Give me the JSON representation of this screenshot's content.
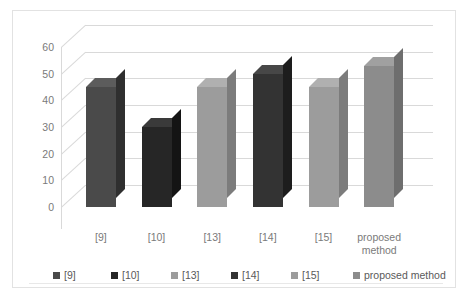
{
  "chart_data": {
    "type": "bar",
    "title": "",
    "xlabel": "",
    "ylabel": "",
    "categories": [
      "[9]",
      "[10]",
      "[13]",
      "[14]",
      "[15]",
      "proposed method"
    ],
    "values": [
      45,
      30,
      45,
      50,
      45,
      53
    ],
    "series": [
      {
        "name": "comparison",
        "values": [
          45,
          30,
          45,
          50,
          45,
          53
        ]
      }
    ],
    "ylim": [
      0,
      60
    ],
    "ytick_labels": [
      "60",
      "50",
      "40",
      "30",
      "20",
      "10",
      "0"
    ],
    "ytick_values": [
      60,
      50,
      40,
      30,
      20,
      10,
      0
    ],
    "grid": true,
    "three_d": true,
    "legend_position": "bottom",
    "legend": [
      {
        "label": "[9]",
        "color": "#4a4a4a"
      },
      {
        "label": "[10]",
        "color": "#262626"
      },
      {
        "label": "[13]",
        "color": "#9c9c9c"
      },
      {
        "label": "[14]",
        "color": "#333333"
      },
      {
        "label": "[15]",
        "color": "#9c9c9c"
      },
      {
        "label": "proposed method",
        "color": "#8c8c8c"
      }
    ],
    "bars": [
      {
        "label": "[9]",
        "value": 45,
        "face": "#4a4a4a",
        "top": "#5c5c5c",
        "side": "#2f2f2f"
      },
      {
        "label": "[10]",
        "value": 30,
        "face": "#262626",
        "top": "#3a3a3a",
        "side": "#141414"
      },
      {
        "label": "[13]",
        "value": 45,
        "face": "#9c9c9c",
        "top": "#b0b0b0",
        "side": "#7c7c7c"
      },
      {
        "label": "[14]",
        "value": 50,
        "face": "#333333",
        "top": "#474747",
        "side": "#1d1d1d"
      },
      {
        "label": "[15]",
        "value": 45,
        "face": "#9c9c9c",
        "top": "#b0b0b0",
        "side": "#7c7c7c"
      },
      {
        "label": "proposed method",
        "value": 53,
        "face": "#8c8c8c",
        "top": "#a0a0a0",
        "side": "#6e6e6e"
      }
    ],
    "colors": {
      "gridline": "#d9d9d9",
      "axis_text": "#7a7a7a",
      "legend_text": "#5a5a5a",
      "frame": "#e2e2e2",
      "background": "#ffffff"
    }
  }
}
